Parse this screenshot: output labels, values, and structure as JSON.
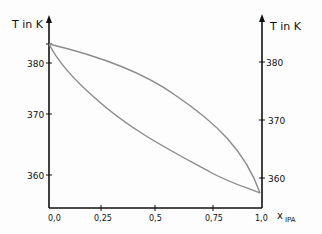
{
  "diagram": {
    "left_axis_label": "T in K",
    "right_axis_label": "T in K",
    "x_axis_label": "x",
    "x_axis_subscript": "IPA",
    "left_ticks": [
      {
        "label": "380",
        "y": 63
      },
      {
        "label": "370",
        "y": 114
      },
      {
        "label": "360",
        "y": 175
      }
    ],
    "right_ticks": [
      {
        "label": "380",
        "y": 62
      },
      {
        "label": "370",
        "y": 120
      },
      {
        "label": "360",
        "y": 178
      }
    ],
    "x_ticks": [
      {
        "label": "0,0",
        "x": 49
      },
      {
        "label": "0,25",
        "x": 101
      },
      {
        "label": "0,5",
        "x": 155
      },
      {
        "label": "0,75",
        "x": 213
      },
      {
        "label": "1,0",
        "x": 262
      }
    ],
    "curves": [
      {
        "name": "dew-curve",
        "color": "#8a8a8a"
      },
      {
        "name": "bubble-curve",
        "color": "#8a8a8a"
      }
    ]
  }
}
